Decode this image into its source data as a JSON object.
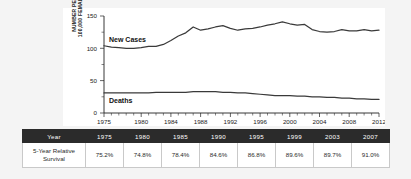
{
  "chart_data": {
    "type": "line",
    "title": "",
    "xlabel": "",
    "ylabel": "NUMBER PER\n100,000 FEMALES",
    "ylim": [
      0,
      150
    ],
    "yticks": [
      0,
      50,
      100,
      150
    ],
    "xlim": [
      1975,
      2012
    ],
    "xticks": [
      "1975",
      "1980",
      "1984",
      "1988",
      "1992",
      "1996",
      "2000",
      "2004",
      "2008",
      "2012"
    ],
    "grid": false,
    "legend_position": "inline-annotation",
    "annotations": [
      "New Cases",
      "Deaths"
    ],
    "x": [
      1975,
      1976,
      1977,
      1978,
      1979,
      1980,
      1981,
      1982,
      1983,
      1984,
      1985,
      1986,
      1987,
      1988,
      1989,
      1990,
      1991,
      1992,
      1993,
      1994,
      1995,
      1996,
      1997,
      1998,
      1999,
      2000,
      2001,
      2002,
      2003,
      2004,
      2005,
      2006,
      2007,
      2008,
      2009,
      2010,
      2011,
      2012
    ],
    "series": [
      {
        "name": "New Cases",
        "values": [
          104,
          102,
          101,
          100,
          100,
          101,
          103,
          103,
          106,
          112,
          119,
          124,
          133,
          128,
          130,
          133,
          135,
          131,
          128,
          130,
          131,
          133,
          136,
          138,
          141,
          138,
          136,
          137,
          129,
          126,
          125,
          126,
          129,
          127,
          127,
          129,
          127,
          128
        ]
      },
      {
        "name": "Deaths",
        "values": [
          31,
          31,
          31,
          31,
          31,
          31,
          31,
          32,
          32,
          32,
          32,
          32,
          33,
          33,
          33,
          33,
          32,
          32,
          31,
          31,
          30,
          29,
          28,
          27,
          27,
          27,
          26,
          26,
          25,
          25,
          24,
          24,
          23,
          23,
          22,
          22,
          21,
          21
        ]
      }
    ]
  },
  "table": {
    "header": {
      "row_label": "Year",
      "years": [
        "1975",
        "1980",
        "1985",
        "1990",
        "1995",
        "1999",
        "2003",
        "2007"
      ]
    },
    "row": {
      "label_line1": "5-Year Relative",
      "label_line2": "Survival",
      "values": [
        "75.2%",
        "74.8%",
        "78.4%",
        "84.6%",
        "86.8%",
        "89.6%",
        "89.7%",
        "91.0%"
      ]
    }
  },
  "colors": {
    "line": "#3a3a3a",
    "header_bg": "#2b2b2b",
    "header_text": "#ffffff",
    "panel_bg": "#ffffff",
    "page_bg": "#f4f4f4"
  }
}
